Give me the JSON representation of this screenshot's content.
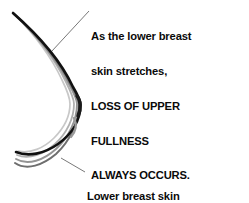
{
  "diagram": {
    "background_color": "#ffffff",
    "text_color": "#0a0a0a",
    "annotations": {
      "upper": {
        "lines": [
          "As the lower breast",
          "skin stretches,",
          "LOSS OF UPPER",
          "FULLNESS",
          "ALWAYS OCCURS."
        ]
      },
      "lower": {
        "lines": [
          "Lower breast skin",
          "STRETCHES AND SAGS."
        ]
      }
    },
    "leader_lines": {
      "upper": {
        "from_x": 89,
        "from_y": 11,
        "to_x": 52,
        "to_y": 51
      },
      "lower": {
        "from_x": 85,
        "from_y": 172,
        "to_x": 61,
        "to_y": 158
      },
      "color": "#555555"
    },
    "profile_curves": {
      "description": "Nested breast profile outlines showing progressive skin stretch, darkest is the most sagging/outermost contour",
      "strokes": [
        {
          "name": "contour-1-innermost",
          "color": "#c8c8c8",
          "width": 1.7
        },
        {
          "name": "contour-2",
          "color": "#b0b0b0",
          "width": 1.8
        },
        {
          "name": "contour-3",
          "color": "#949494",
          "width": 1.9
        },
        {
          "name": "contour-4",
          "color": "#6e6e6e",
          "width": 2.0
        },
        {
          "name": "contour-5-outermost",
          "color": "#111111",
          "width": 2.6
        }
      ],
      "upper_tip": {
        "x": 13,
        "y": 13
      },
      "nipple_point": {
        "x": 80,
        "y": 104
      },
      "lower_tip": {
        "x": 16,
        "y": 152
      }
    }
  }
}
